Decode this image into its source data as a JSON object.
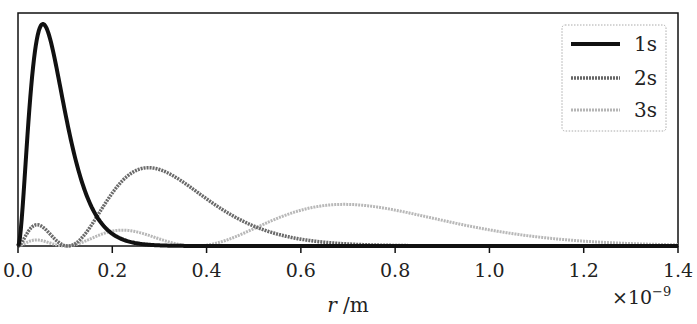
{
  "chart_data": {
    "type": "line",
    "title": "",
    "xlabel": "r /m",
    "xlabel_italic_part": "r",
    "xlabel_unit_part": "/m",
    "ylabel": "",
    "x_scale_note": "×10⁻⁹",
    "xlim": [
      0.0,
      1.4
    ],
    "xticks": [
      "0.0",
      "0.2",
      "0.4",
      "0.6",
      "0.8",
      "1.0",
      "1.2",
      "1.4"
    ],
    "yticks": [],
    "grid": false,
    "legend_position": "upper right",
    "series": [
      {
        "name": "1s",
        "color": "#111111",
        "style": "solid-thick",
        "peak_x": 0.053,
        "peak_rel_height": 1.0
      },
      {
        "name": "2s",
        "color": "#666666",
        "style": "hatched",
        "peak_x": 0.277,
        "peak_rel_height": 0.35
      },
      {
        "name": "3s",
        "color": "#b0b0b0",
        "style": "hatched-light",
        "peak_x": 0.69,
        "peak_rel_height": 0.19
      }
    ],
    "x": [
      0.0,
      0.05,
      0.1,
      0.15,
      0.2,
      0.25,
      0.3,
      0.35,
      0.4,
      0.5,
      0.6,
      0.7,
      0.8,
      1.0,
      1.2,
      1.4
    ],
    "note": "Radial probability densities of hydrogen-like 1s, 2s, 3s orbitals (arbitrary units)"
  },
  "legend": {
    "items": [
      {
        "label": "1s"
      },
      {
        "label": "2s"
      },
      {
        "label": "3s"
      }
    ]
  },
  "axis": {
    "x_label_r": "r",
    "x_label_unit": " /m",
    "multiplier": "×10",
    "multiplier_exp": "−9"
  }
}
